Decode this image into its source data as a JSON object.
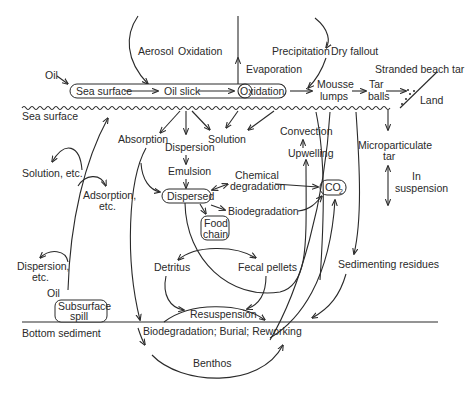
{
  "diagram": {
    "regions": {
      "sea_surface": "Sea surface",
      "bottom_sediment": "Bottom sediment",
      "land": "Land"
    },
    "atmosphere": {
      "aerosol": "Aerosol",
      "oxidation": "Oxidation",
      "evaporation": "Evaporation",
      "precipitation": "Precipitation",
      "dry_fallout": "Dry fallout"
    },
    "surface": {
      "oil_input": "Oil",
      "box_sea_surface": "Sea surface",
      "box_oil_slick": "Oil slick",
      "box_oxidation": "Oxidation",
      "mousse_1": "Mousse",
      "mousse_2": "lumps",
      "tar_1": "Tar",
      "tar_2": "balls",
      "stranded": "Stranded beach tar"
    },
    "water_column": {
      "absorption": "Absorption",
      "dispersion": "Dispersion",
      "solution": "Solution",
      "emulsion": "Emulsion",
      "dispersed": "Dispersed",
      "chem_deg_1": "Chemical",
      "chem_deg_2": "degradation",
      "biodegradation": "Biodegradation",
      "co2": "CO",
      "co2_sub": "2",
      "convection": "Convection",
      "upwelling": "Upwelling",
      "food_chain_1": "Food",
      "food_chain_2": "chain",
      "detritus": "Detritus",
      "fecal_pellets": "Fecal pellets",
      "micro_tar_1": "Microparticulate",
      "micro_tar_2": "tar",
      "in_susp_1": "In",
      "in_susp_2": "suspension",
      "sedimenting": "Sedimenting residues",
      "solution_etc": "Solution, etc.",
      "adsorption_1": "Adsorption,",
      "adsorption_2": "etc.",
      "dispersion_etc_1": "Dispersion,",
      "dispersion_etc_2": "etc.",
      "subsurface_oil": "Oil",
      "subsurface_1": "Subsurface",
      "subsurface_2": "spill"
    },
    "sediment": {
      "resuspension": "Resuspension",
      "processes": "Biodegradation; Burial; Reworking",
      "benthos": "Benthos"
    },
    "colors": {
      "ink": "#2a2a2a",
      "background": "#ffffff"
    }
  }
}
